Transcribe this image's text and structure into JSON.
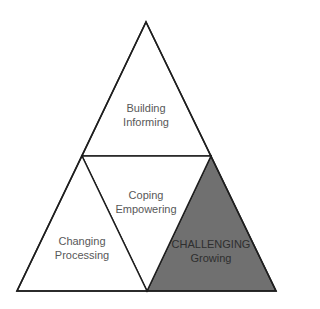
{
  "diagram": {
    "type": "triangle-pyramid",
    "colors": {
      "stroke": "#1e1e1e",
      "fill_default": "#ffffff",
      "fill_highlight": "#707070",
      "text": "#585858",
      "text_on_highlight": "#2e2e2e"
    },
    "sections": [
      {
        "id": "top",
        "position": "top triangle",
        "line1": "Building",
        "line2": "Informing",
        "highlighted": false
      },
      {
        "id": "middle",
        "position": "inverted center triangle",
        "line1": "Coping",
        "line2": "Empowering",
        "highlighted": false
      },
      {
        "id": "bottom-left",
        "position": "bottom-left triangle",
        "line1": "Changing",
        "line2": "Processing",
        "highlighted": false
      },
      {
        "id": "bottom-right",
        "position": "bottom-right triangle",
        "line1": "CHALLENGING",
        "line2": "Growing",
        "highlighted": true
      }
    ]
  }
}
